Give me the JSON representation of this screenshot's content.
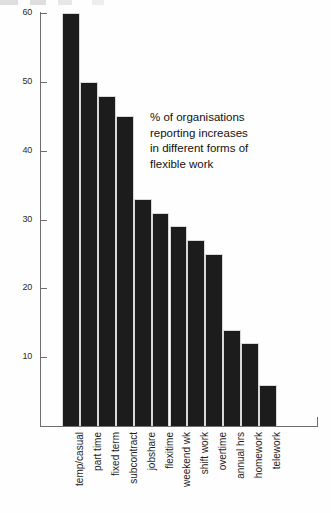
{
  "chart_data": {
    "type": "bar",
    "title": "",
    "xlabel": "",
    "ylabel": "",
    "ylim": [
      0,
      62
    ],
    "yticks": [
      10,
      20,
      30,
      40,
      50,
      60
    ],
    "grid": false,
    "legend": "none",
    "bar_color": "#1c1c1c",
    "axis_color": "#6e6e6e",
    "categories": [
      "temp/casual",
      "part time",
      "fixed term",
      "subcontract",
      "jobshare",
      "flexitime",
      "weekend wk",
      "shift work",
      "overtime",
      "annual hrs",
      "homework",
      "telework"
    ],
    "values": [
      60,
      50,
      48,
      45,
      33,
      31,
      29,
      27,
      25,
      14,
      12,
      6
    ],
    "annotation": {
      "lines": [
        "% of organisations",
        "reporting increases",
        "in different forms of",
        "flexible work"
      ]
    }
  }
}
